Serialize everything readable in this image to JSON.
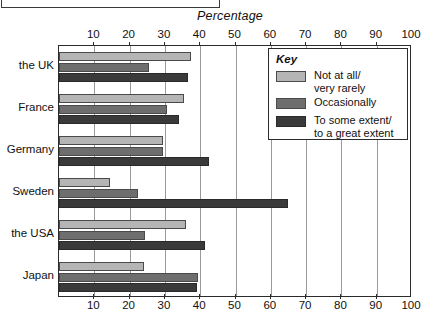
{
  "caption_box": {
    "text": ""
  },
  "chart_data": {
    "type": "bar",
    "orientation": "horizontal",
    "title": "Percentage",
    "xlabel": "Percentage",
    "ylabel": "",
    "xlim": [
      0,
      100
    ],
    "xticks": [
      0,
      10,
      20,
      30,
      40,
      50,
      60,
      70,
      80,
      90,
      100
    ],
    "xtick_labels": [
      "",
      "10",
      "20",
      "30",
      "40",
      "50",
      "60",
      "70",
      "80",
      "90",
      "100"
    ],
    "grid": true,
    "axis_top_labels": true,
    "axis_bottom_labels": true,
    "legend_position": "inside-top-right",
    "legend_title": "Key",
    "categories": [
      "the UK",
      "France",
      "Germany",
      "Sweden",
      "the USA",
      "Japan"
    ],
    "series": [
      {
        "name": "Not at all/\nvery rarely",
        "color": "#b5b5b5",
        "values": [
          37.5,
          35.5,
          29.5,
          14.5,
          36,
          24
        ]
      },
      {
        "name": "Occasionally",
        "color": "#6e6e6e",
        "values": [
          25.5,
          30.5,
          29.5,
          22.5,
          24.5,
          39.5
        ]
      },
      {
        "name": "To some extent/\nto a great extent",
        "color": "#3a3a3a",
        "values": [
          36.5,
          34,
          42.5,
          65,
          41.5,
          39
        ]
      }
    ]
  }
}
